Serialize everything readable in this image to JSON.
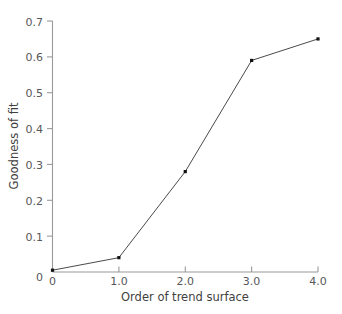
{
  "chart_data": {
    "type": "line",
    "title": "",
    "xlabel": "Order of trend surface",
    "ylabel": "Goodness of fit",
    "x": [
      0,
      1.0,
      2.0,
      3.0,
      4.0
    ],
    "values": [
      0.005,
      0.04,
      0.28,
      0.59,
      0.65
    ],
    "series": [
      {
        "name": "Goodness of fit",
        "values": [
          0.005,
          0.04,
          0.28,
          0.59,
          0.65
        ]
      }
    ],
    "xlim": [
      0,
      4.0
    ],
    "ylim": [
      0,
      0.7
    ],
    "xticks": [
      0,
      1.0,
      2.0,
      3.0,
      4.0
    ],
    "yticks": [
      0,
      0.1,
      0.2,
      0.3,
      0.4,
      0.5,
      0.6,
      0.7
    ],
    "xtick_labels": [
      "0",
      "1.0",
      "2.0",
      "3.0",
      "4.0"
    ],
    "ytick_labels": [
      "0",
      "0.1",
      "0.2",
      "0.3",
      "0.4",
      "0.5",
      "0.6",
      "0.7"
    ],
    "grid": false,
    "legend": "none",
    "marker": "square",
    "colors": {
      "line": "#4a4a4c",
      "marker": "#111111",
      "axis": "#9a9a9c",
      "text": "#58585a",
      "background": "#ffffff"
    }
  },
  "axes": {
    "x_title": "Order of trend surface",
    "y_title": "Goodness of fit"
  },
  "ytick_labels": {
    "t0": "0.7",
    "t1": "0.6",
    "t2": "0.5",
    "t3": "0.4",
    "t4": "0.3",
    "t5": "0.2",
    "t6": "0.1",
    "t7": "0"
  },
  "xtick_labels": {
    "t0": "0",
    "t1": "1.0",
    "t2": "2.0",
    "t3": "3.0",
    "t4": "4.0"
  }
}
